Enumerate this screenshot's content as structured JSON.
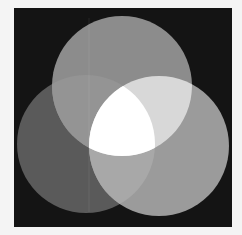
{
  "diagram": {
    "type": "three-circle-venn",
    "background_color": "#141414",
    "page_color": "#f4f4f4",
    "circles": [
      {
        "id": "top",
        "color": "#8c8c8c"
      },
      {
        "id": "left",
        "color": "#5a5a5a"
      },
      {
        "id": "right",
        "color": "#9b9b9b"
      }
    ],
    "overlaps": {
      "top_left": "#949494",
      "left_right": "#a8a8a8",
      "top_right": "#d8d8d8",
      "all_three": "#ffffff"
    },
    "labels": []
  }
}
